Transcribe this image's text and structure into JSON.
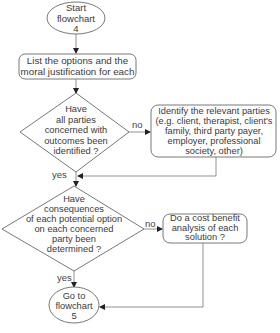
{
  "flowchart": {
    "start": {
      "text": "Start\nflowchart\n4"
    },
    "list_options": {
      "text": "List the options and the\nmoral justification for each"
    },
    "decision_parties": {
      "text": "Have\nall parties\nconcerned with\noutcomes been\nidentified ?"
    },
    "identify_parties": {
      "text": "Identify the relevant parties\n(e.g. client, therapist, client's\nfamily, third party payer,\nemployer, professional\nsociety, other)"
    },
    "decision_consequences": {
      "text": "Have\nconsequences\nof each potential option\non each concerned\nparty been\ndetermined ?"
    },
    "cost_benefit": {
      "text": "Do a cost benefit\nanalysis of each\nsolution ?"
    },
    "end": {
      "text": "Go to\nflowchart\n5"
    },
    "labels": {
      "no1": "no",
      "yes1": "yes",
      "no2": "no",
      "yes2": "yes"
    }
  }
}
